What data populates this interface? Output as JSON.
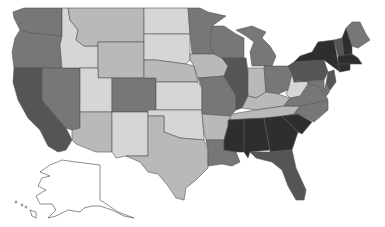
{
  "map": {
    "title": "",
    "type": "choropleth",
    "region": "United States",
    "shades": {
      "lightest": "#d6d6d6",
      "light": "#b9b9b9",
      "medium": "#9a9a9a",
      "dark": "#777777",
      "darker": "#555555",
      "darkest": "#2e2e2e",
      "none": "#ffffff"
    },
    "states": [
      {
        "id": "WA",
        "shade": "dark"
      },
      {
        "id": "OR",
        "shade": "dark"
      },
      {
        "id": "CA",
        "shade": "darker"
      },
      {
        "id": "NV",
        "shade": "dark"
      },
      {
        "id": "ID",
        "shade": "lightest"
      },
      {
        "id": "MT",
        "shade": "light"
      },
      {
        "id": "WY",
        "shade": "light"
      },
      {
        "id": "UT",
        "shade": "lightest"
      },
      {
        "id": "AZ",
        "shade": "light"
      },
      {
        "id": "CO",
        "shade": "dark"
      },
      {
        "id": "NM",
        "shade": "lightest"
      },
      {
        "id": "ND",
        "shade": "lightest"
      },
      {
        "id": "SD",
        "shade": "lightest"
      },
      {
        "id": "NE",
        "shade": "light"
      },
      {
        "id": "KS",
        "shade": "lightest"
      },
      {
        "id": "OK",
        "shade": "lightest"
      },
      {
        "id": "TX",
        "shade": "light"
      },
      {
        "id": "MN",
        "shade": "dark"
      },
      {
        "id": "IA",
        "shade": "light"
      },
      {
        "id": "MO",
        "shade": "dark"
      },
      {
        "id": "AR",
        "shade": "light"
      },
      {
        "id": "LA",
        "shade": "dark"
      },
      {
        "id": "WI",
        "shade": "dark"
      },
      {
        "id": "IL",
        "shade": "darker"
      },
      {
        "id": "MI",
        "shade": "dark"
      },
      {
        "id": "IN",
        "shade": "light"
      },
      {
        "id": "OH",
        "shade": "dark"
      },
      {
        "id": "KY",
        "shade": "light"
      },
      {
        "id": "TN",
        "shade": "light"
      },
      {
        "id": "MS",
        "shade": "darkest"
      },
      {
        "id": "AL",
        "shade": "darkest"
      },
      {
        "id": "GA",
        "shade": "darkest"
      },
      {
        "id": "FL",
        "shade": "darker"
      },
      {
        "id": "SC",
        "shade": "darkest"
      },
      {
        "id": "NC",
        "shade": "dark"
      },
      {
        "id": "VA",
        "shade": "dark"
      },
      {
        "id": "WV",
        "shade": "lightest"
      },
      {
        "id": "PA",
        "shade": "darker"
      },
      {
        "id": "NY",
        "shade": "darkest"
      },
      {
        "id": "VT",
        "shade": "darker"
      },
      {
        "id": "NH",
        "shade": "darkest"
      },
      {
        "id": "ME",
        "shade": "dark"
      },
      {
        "id": "MA",
        "shade": "darkest"
      },
      {
        "id": "CT",
        "shade": "darkest"
      },
      {
        "id": "NJ",
        "shade": "darker"
      },
      {
        "id": "DE",
        "shade": "dark"
      },
      {
        "id": "MD",
        "shade": "dark"
      },
      {
        "id": "AK",
        "shade": "none"
      },
      {
        "id": "HI",
        "shade": "none"
      }
    ]
  }
}
